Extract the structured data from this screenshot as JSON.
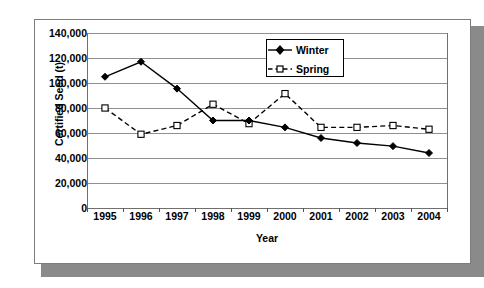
{
  "chart_data": {
    "type": "line",
    "title": "",
    "xlabel": "Year",
    "ylabel": "Certified Seed (t)",
    "categories": [
      "1995",
      "1996",
      "1997",
      "1998",
      "1999",
      "2000",
      "2001",
      "2002",
      "2003",
      "2004"
    ],
    "ylim": [
      0,
      140000
    ],
    "ytick_values": [
      0,
      20000,
      40000,
      60000,
      80000,
      100000,
      120000,
      140000
    ],
    "ytick_labels": [
      "0",
      "20,000",
      "40,000",
      "60,000",
      "80,000",
      "100,000",
      "120,000",
      "140,000"
    ],
    "grid": "horizontal",
    "legend_position": "top-right",
    "series": [
      {
        "name": "Winter",
        "line_style": "solid",
        "marker": "filled-diamond",
        "color": "#000000",
        "values": [
          105000,
          117000,
          95500,
          70000,
          70000,
          64500,
          56000,
          52000,
          49500,
          44000
        ]
      },
      {
        "name": "Spring",
        "line_style": "dashed",
        "marker": "open-square",
        "color": "#000000",
        "values": [
          80000,
          59000,
          66000,
          83000,
          67500,
          91500,
          64500,
          64500,
          66000,
          63000
        ]
      }
    ]
  },
  "legend": {
    "items": [
      {
        "label": "Winter"
      },
      {
        "label": "Spring"
      }
    ]
  },
  "axes": {
    "y_title": "Certified Seed (t)",
    "x_title": "Year"
  }
}
